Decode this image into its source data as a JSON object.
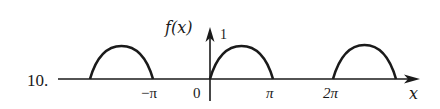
{
  "problem_number": "10.",
  "axis": {
    "y_label": "f(x)",
    "x_label": "x",
    "y_tick": "1",
    "x_ticks": [
      {
        "label": "−π",
        "value": -3.14159
      },
      {
        "label": "0",
        "value": 0
      },
      {
        "label": "π",
        "value": 3.14159
      },
      {
        "label": "2π",
        "value": 6.28318
      }
    ]
  },
  "curve": {
    "description": "Half-wave rectified sine, period 2π: f(x)=sin x on [2kπ,(2k+1)π], 0 otherwise",
    "arcs": [
      {
        "from": "−2π",
        "to": "−π"
      },
      {
        "from": "0",
        "to": "π"
      },
      {
        "from": "2π",
        "to": "3π"
      }
    ],
    "peak_value": 1
  },
  "colors": {
    "ink": "#1a1a1a",
    "background": "#ffffff"
  }
}
